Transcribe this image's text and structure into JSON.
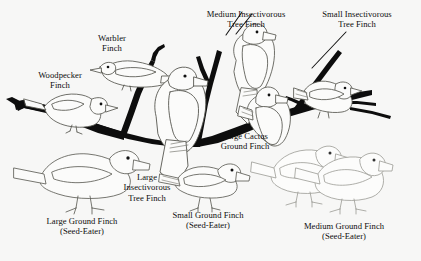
{
  "figure": {
    "background_color": "#f7f7f6",
    "ink_color": "#0d0d0d",
    "outline_color": "#5a5a56",
    "faint_outline_color": "#8c8c88",
    "width": 421,
    "height": 261
  },
  "labels": {
    "woodpecker_finch": {
      "line1": "Woodpecker",
      "line2": "Finch"
    },
    "warbler_finch": {
      "line1": "Warbler",
      "line2": "Finch"
    },
    "medium_insectivorous_tree_finch": {
      "line1": "Medium Insectivorous",
      "line2": "Tree Finch"
    },
    "small_insectivorous_tree_finch": {
      "line1": "Small Insectivorous",
      "line2": "Tree Finch"
    },
    "large_cactus_ground_finch": {
      "line1": "Large Cactus",
      "line2": "Ground Finch"
    },
    "large_insectivorous_tree_finch": {
      "line1": "Large",
      "line2": "Insectivorous",
      "line3": "Tree Finch"
    },
    "large_ground_finch": {
      "line1": "Large Ground Finch",
      "line2": "(Seed-Eater)"
    },
    "small_ground_finch": {
      "line1": "Small Ground Finch",
      "line2": "(Seed-Eater)"
    },
    "medium_ground_finch": {
      "line1": "Medium Ground Finch",
      "line2": "(Seed-Eater)"
    }
  }
}
